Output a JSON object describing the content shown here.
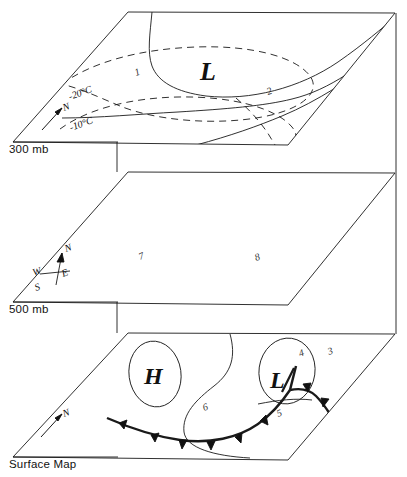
{
  "figure": {
    "type": "atmospheric-level-stack-diagram",
    "panel_count": 3,
    "background_color": "#ffffff",
    "line_color": "#1a1a1a"
  },
  "levels": [
    {
      "id": "300mb",
      "label": "300 mb"
    },
    {
      "id": "500mb",
      "label": "500 mb"
    },
    {
      "id": "surface",
      "label": "Surface Map"
    }
  ],
  "panel_300mb": {
    "title": "300 mb",
    "pressure_center": {
      "symbol": "L",
      "type": "low"
    },
    "isotherms": [
      {
        "label": "-20°C",
        "style": "dashed"
      },
      {
        "label": "-10°C",
        "style": "dashed"
      }
    ],
    "height_contours": [
      {
        "label": "1",
        "style": "solid"
      },
      {
        "label": "2",
        "style": "solid"
      }
    ],
    "compass": {
      "north": "N"
    }
  },
  "panel_500mb": {
    "title": "500 mb",
    "feature_labels": [
      "7",
      "8"
    ],
    "compass": {
      "north": "N",
      "south": "S",
      "east": "E",
      "west": "W"
    }
  },
  "panel_surface": {
    "title": "Surface Map",
    "pressure_centers": [
      {
        "symbol": "H",
        "type": "high"
      },
      {
        "symbol": "L",
        "type": "low"
      }
    ],
    "isobar_labels": [
      "3",
      "4",
      "5",
      "6"
    ],
    "fronts": [
      {
        "type": "cold-front",
        "marker": "triangle"
      },
      {
        "type": "warm-front",
        "marker": "semicircle"
      },
      {
        "type": "occluded-front",
        "marker": "triangle-semicircle"
      }
    ],
    "compass": {
      "north": "N"
    }
  },
  "callout_numbers": [
    "1",
    "2",
    "3",
    "4",
    "5",
    "6",
    "7",
    "8"
  ]
}
